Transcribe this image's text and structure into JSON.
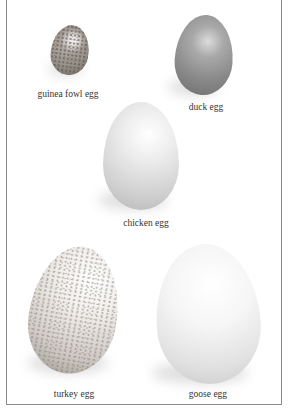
{
  "eggs": [
    {
      "id": "guinea",
      "label": "guinea fowl egg"
    },
    {
      "id": "duck",
      "label": "duck egg"
    },
    {
      "id": "chicken",
      "label": "chicken egg"
    },
    {
      "id": "turkey",
      "label": "turkey egg"
    },
    {
      "id": "goose",
      "label": "goose egg"
    }
  ]
}
